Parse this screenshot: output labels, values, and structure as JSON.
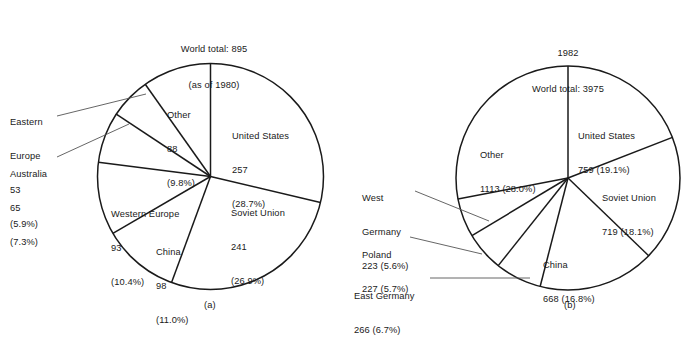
{
  "figure": {
    "caption_a": "(a)",
    "caption_b": "(b)"
  },
  "chart_data": [
    {
      "type": "pie",
      "id": "pie-a",
      "title": "World total: 895\n(as of 1980)",
      "title_line1": "World total: 895",
      "title_line2": "(as of 1980)",
      "caption": "(a)",
      "year": "1980",
      "total": 895,
      "units_note": "as of 1980",
      "start_angle_deg": 0,
      "direction": "clockwise",
      "categories": [
        "United States",
        "Soviet Union",
        "China",
        "Western Europe",
        "Australia",
        "Eastern Europe",
        "Other"
      ],
      "values": [
        257,
        241,
        98,
        93,
        65,
        53,
        88
      ],
      "percents": [
        28.7,
        26.9,
        11.0,
        10.4,
        7.3,
        5.9,
        9.8
      ],
      "slices": [
        {
          "name": "United States",
          "value": 257,
          "percent": 28.7,
          "label_line1": "United States",
          "label_line2": "257",
          "label_line3": "(28.7%)",
          "callout": false
        },
        {
          "name": "Soviet Union",
          "value": 241,
          "percent": 26.9,
          "label_line1": "Soviet Union",
          "label_line2": "241",
          "label_line3": "(26.9%)",
          "callout": false
        },
        {
          "name": "China",
          "value": 98,
          "percent": 11.0,
          "label_line1": "China",
          "label_line2": "98",
          "label_line3": "(11.0%)",
          "callout": false
        },
        {
          "name": "Western Europe",
          "value": 93,
          "percent": 10.4,
          "label_line1": "Western Europe",
          "label_line2": "93",
          "label_line3": "(10.4%)",
          "callout": false
        },
        {
          "name": "Australia",
          "value": 65,
          "percent": 7.3,
          "label_line1": "Australia",
          "label_line2": "65",
          "label_line3": "(7.3%)",
          "callout": true
        },
        {
          "name": "Eastern Europe",
          "value": 53,
          "percent": 5.9,
          "label_line1": "Eastern",
          "label_line2": "Europe",
          "label_line3": "53",
          "label_line4": "(5.9%)",
          "callout": true
        },
        {
          "name": "Other",
          "value": 88,
          "percent": 9.8,
          "label_line1": "Other",
          "label_line2": "88",
          "label_line3": "(9.8%)",
          "callout": false
        }
      ]
    },
    {
      "type": "pie",
      "id": "pie-b",
      "title": "1982\nWorld total: 3975",
      "title_line1": "1982",
      "title_line2": "World total: 3975",
      "caption": "(b)",
      "year": "1982",
      "total": 3975,
      "start_angle_deg": 0,
      "direction": "clockwise",
      "categories": [
        "United States",
        "Soviet Union",
        "China",
        "East Germany",
        "Poland",
        "West Germany",
        "Other"
      ],
      "values": [
        759,
        719,
        668,
        266,
        227,
        223,
        1113
      ],
      "percents": [
        19.1,
        18.1,
        16.8,
        6.7,
        5.7,
        5.6,
        28.0
      ],
      "slices": [
        {
          "name": "United States",
          "value": 759,
          "percent": 19.1,
          "label_line1": "United States",
          "label_line2": "759 (19.1%)",
          "callout": false
        },
        {
          "name": "Soviet Union",
          "value": 719,
          "percent": 18.1,
          "label_line1": "Soviet Union",
          "label_line2": "719 (18.1%)",
          "callout": false
        },
        {
          "name": "China",
          "value": 668,
          "percent": 16.8,
          "label_line1": "China",
          "label_line2": "668 (16.8%)",
          "callout": false
        },
        {
          "name": "East Germany",
          "value": 266,
          "percent": 6.7,
          "label_line1": "East Germany",
          "label_line2": "266 (6.7%)",
          "callout": true
        },
        {
          "name": "Poland",
          "value": 227,
          "percent": 5.7,
          "label_line1": "Poland",
          "label_line2": "227 (5.7%)",
          "callout": true
        },
        {
          "name": "West Germany",
          "value": 223,
          "percent": 5.6,
          "label_line1": "West",
          "label_line2": "Germany",
          "label_line3": "223 (5.6%)",
          "callout": true
        },
        {
          "name": "Other",
          "value": 1113,
          "percent": 28.0,
          "label_line1": "Other",
          "label_line2": "1113 (28.0%)",
          "callout": false
        }
      ]
    }
  ],
  "colors": {
    "stroke": "#1a1a1a",
    "leader": "#555555",
    "background": "#ffffff",
    "text": "#1a1a1a"
  }
}
